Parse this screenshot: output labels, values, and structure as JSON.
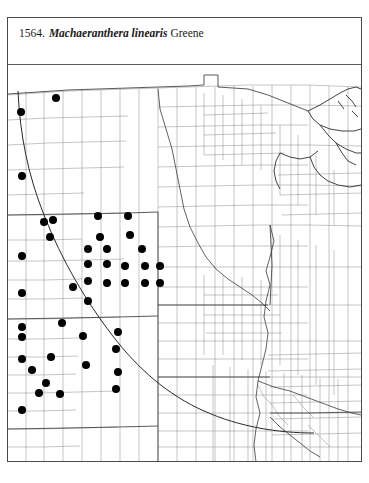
{
  "plate": {
    "number": "1564.",
    "taxon": "Machaeranthera linearis",
    "authority": "Greene"
  },
  "map": {
    "kind": "county-level-dot-distribution-map",
    "region_label": "Great Plains and Midwest, United States",
    "symbol_meaning": "filled black dot = county with documented occurrence",
    "colors": {
      "county_boundary": "#8a8a8a",
      "state_boundary": "#3c3c3c",
      "coastline": "#2e2e2e",
      "range_line": "#2a2a2a",
      "occurrence_dot": "#000000",
      "frame": "#4a4a4a",
      "background": "#ffffff"
    },
    "dot_diameter_px": 8,
    "occurrence_count": 43,
    "occurrences": [
      {
        "x": 13,
        "y": 47
      },
      {
        "x": 48,
        "y": 33
      },
      {
        "x": 14,
        "y": 111
      },
      {
        "x": 45,
        "y": 155
      },
      {
        "x": 14,
        "y": 191
      },
      {
        "x": 42,
        "y": 172
      },
      {
        "x": 36,
        "y": 157
      },
      {
        "x": 14,
        "y": 228
      },
      {
        "x": 90,
        "y": 151
      },
      {
        "x": 120,
        "y": 151
      },
      {
        "x": 122,
        "y": 170
      },
      {
        "x": 92,
        "y": 172
      },
      {
        "x": 80,
        "y": 184
      },
      {
        "x": 99,
        "y": 184
      },
      {
        "x": 134,
        "y": 184
      },
      {
        "x": 80,
        "y": 199
      },
      {
        "x": 99,
        "y": 199
      },
      {
        "x": 117,
        "y": 201
      },
      {
        "x": 137,
        "y": 201
      },
      {
        "x": 152,
        "y": 201
      },
      {
        "x": 80,
        "y": 216
      },
      {
        "x": 99,
        "y": 218
      },
      {
        "x": 117,
        "y": 218
      },
      {
        "x": 137,
        "y": 218
      },
      {
        "x": 152,
        "y": 218
      },
      {
        "x": 65,
        "y": 222
      },
      {
        "x": 80,
        "y": 236
      },
      {
        "x": 14,
        "y": 262
      },
      {
        "x": 54,
        "y": 258
      },
      {
        "x": 14,
        "y": 272
      },
      {
        "x": 75,
        "y": 271
      },
      {
        "x": 14,
        "y": 294
      },
      {
        "x": 78,
        "y": 300
      },
      {
        "x": 110,
        "y": 267
      },
      {
        "x": 110,
        "y": 307
      },
      {
        "x": 43,
        "y": 292
      },
      {
        "x": 24,
        "y": 305
      },
      {
        "x": 38,
        "y": 318
      },
      {
        "x": 52,
        "y": 329
      },
      {
        "x": 31,
        "y": 328
      },
      {
        "x": 14,
        "y": 345
      },
      {
        "x": 108,
        "y": 284
      },
      {
        "x": 108,
        "y": 324
      }
    ]
  }
}
